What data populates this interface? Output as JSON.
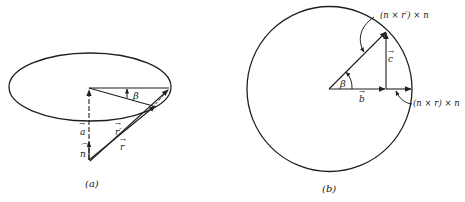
{
  "figure": {
    "panel_a": {
      "caption": "(a)",
      "labels": {
        "a": "a",
        "n": "n",
        "r_prime": "r′",
        "r": "r",
        "beta": "β"
      }
    },
    "panel_b": {
      "caption": "(b)",
      "labels": {
        "top": "(n × r′) × n",
        "right": "(n × r) × n",
        "c": "c",
        "b": "b",
        "beta": "β"
      }
    }
  }
}
